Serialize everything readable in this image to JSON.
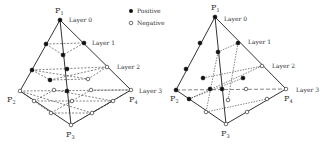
{
  "legend": {
    "items": [
      {
        "marker": "filled-circle",
        "label": "Positive"
      },
      {
        "marker": "open-circle",
        "label": "Negative"
      }
    ]
  },
  "diagrams": [
    {
      "vertices": {
        "p1": "P",
        "p1_sub": "1",
        "p2": "P",
        "p2_sub": "2",
        "p3": "P",
        "p3_sub": "3",
        "p4": "P",
        "p4_sub": "4"
      },
      "layers": [
        "Layer 0",
        "Layer 1",
        "Layer 2",
        "Layer 3"
      ]
    },
    {
      "vertices": {
        "p1": "P",
        "p1_sub": "1",
        "p2": "P",
        "p2_sub": "2",
        "p3": "P",
        "p3_sub": "3",
        "p4": "P",
        "p4_sub": "4"
      },
      "layers": [
        "Layer 0",
        "Layer 1",
        "Layer 2",
        "Layer 3"
      ]
    }
  ],
  "colors": {
    "line": "#333333",
    "positive": "#111111",
    "negative": "#ffffff"
  }
}
